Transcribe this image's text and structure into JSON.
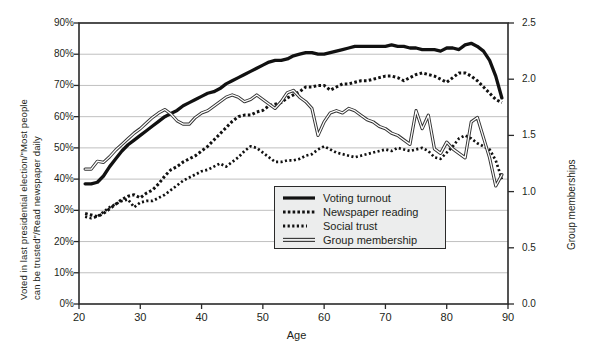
{
  "chart_data": {
    "type": "line",
    "title": "",
    "xlabel": "Age",
    "ylabel_left": "Voted in last presidential election/\"Most people can be trusted\"/Read newspaper daily",
    "ylabel_left_line1": "Voted in last presidential election/\"Most people",
    "ylabel_left_line2": "can be trusted\"/Read newspaper daily",
    "ylabel_right": "Group memberships",
    "xlim": [
      20,
      90
    ],
    "ylim_left": [
      0,
      90
    ],
    "ylim_right": [
      0.0,
      2.5
    ],
    "grid": true,
    "legend_position": "center",
    "xticks": [
      20,
      30,
      40,
      50,
      60,
      70,
      80,
      90
    ],
    "xtick_labels": [
      "20",
      "30",
      "40",
      "50",
      "60",
      "70",
      "80",
      "90"
    ],
    "yticks_left": [
      0,
      10,
      20,
      30,
      40,
      50,
      60,
      70,
      80,
      90
    ],
    "ytick_labels_left": [
      "0%",
      "10%",
      "20%",
      "30%",
      "40%",
      "50%",
      "60%",
      "70%",
      "80%",
      "90%"
    ],
    "yticks_right": [
      0.0,
      0.5,
      1.0,
      1.5,
      2.0,
      2.5
    ],
    "ytick_labels_right": [
      "0.0",
      "0.5",
      "1.0",
      "1.5",
      "2.0",
      "2.5"
    ],
    "x": [
      21,
      22,
      23,
      24,
      25,
      26,
      27,
      28,
      29,
      30,
      31,
      32,
      33,
      34,
      35,
      36,
      37,
      38,
      39,
      40,
      41,
      42,
      43,
      44,
      45,
      46,
      47,
      48,
      49,
      50,
      51,
      52,
      53,
      54,
      55,
      56,
      57,
      58,
      59,
      60,
      61,
      62,
      63,
      64,
      65,
      66,
      67,
      68,
      69,
      70,
      71,
      72,
      73,
      74,
      75,
      76,
      77,
      78,
      79,
      80,
      81,
      82,
      83,
      84,
      85,
      86,
      87,
      88,
      89
    ],
    "series": [
      {
        "name": "Voting turnout",
        "axis": "left",
        "style": "solid-thick",
        "color": "#111111",
        "values": [
          38.5,
          38.5,
          39.0,
          41.0,
          44.0,
          46.5,
          49.0,
          51.0,
          52.5,
          54.0,
          55.5,
          57.0,
          58.5,
          60.0,
          61.0,
          62.0,
          63.5,
          64.5,
          65.5,
          66.5,
          67.5,
          68.0,
          69.0,
          70.5,
          71.5,
          72.5,
          73.5,
          74.5,
          75.5,
          76.5,
          77.5,
          78.0,
          78.0,
          78.5,
          79.5,
          80.0,
          80.5,
          80.5,
          80.0,
          80.0,
          80.5,
          81.0,
          81.5,
          82.0,
          82.5,
          82.5,
          82.5,
          82.5,
          82.5,
          82.5,
          83.0,
          82.5,
          82.5,
          82.0,
          82.0,
          81.5,
          81.5,
          81.5,
          81.0,
          82.0,
          82.0,
          81.5,
          83.0,
          83.5,
          82.5,
          81.0,
          78.0,
          73.0,
          66.0
        ]
      },
      {
        "name": "Newspaper reading",
        "axis": "left",
        "style": "dotted-bold",
        "color": "#111111",
        "values": [
          29.0,
          28.5,
          28.0,
          29.0,
          30.5,
          32.0,
          33.5,
          34.5,
          35.0,
          34.0,
          35.5,
          36.5,
          38.5,
          41.0,
          43.0,
          44.0,
          45.5,
          46.5,
          47.5,
          49.0,
          50.5,
          52.5,
          54.5,
          56.5,
          58.5,
          60.0,
          60.5,
          60.5,
          61.5,
          62.0,
          63.5,
          64.0,
          64.5,
          66.0,
          67.0,
          68.0,
          69.5,
          69.5,
          70.0,
          70.0,
          68.5,
          69.5,
          70.5,
          70.5,
          71.0,
          71.5,
          71.5,
          72.0,
          72.5,
          73.0,
          73.0,
          72.5,
          71.5,
          72.5,
          73.5,
          74.0,
          73.5,
          73.0,
          72.0,
          71.0,
          72.5,
          74.0,
          74.0,
          73.0,
          71.5,
          69.5,
          67.5,
          65.5,
          64.5
        ]
      },
      {
        "name": "Social trust",
        "axis": "left",
        "style": "dotted-fine",
        "color": "#111111",
        "values": [
          28.0,
          27.5,
          28.0,
          29.5,
          31.0,
          32.0,
          33.0,
          33.5,
          31.0,
          32.5,
          33.0,
          33.0,
          34.0,
          35.0,
          36.5,
          38.0,
          39.5,
          40.5,
          41.5,
          42.5,
          43.0,
          44.0,
          45.0,
          44.0,
          45.5,
          47.0,
          49.0,
          50.5,
          50.0,
          48.5,
          47.0,
          45.5,
          45.5,
          46.0,
          46.0,
          46.5,
          47.5,
          48.0,
          49.5,
          50.5,
          49.5,
          48.5,
          48.0,
          47.5,
          47.0,
          47.5,
          48.0,
          48.5,
          49.0,
          49.5,
          49.0,
          50.0,
          49.5,
          49.0,
          49.5,
          50.0,
          49.0,
          47.0,
          46.5,
          48.5,
          50.5,
          53.0,
          54.0,
          53.0,
          51.5,
          50.5,
          49.5,
          46.0,
          40.0
        ]
      },
      {
        "name": "Group membership",
        "axis": "right",
        "style": "double-thin",
        "color": "#444444",
        "values": [
          1.2,
          1.2,
          1.27,
          1.26,
          1.31,
          1.37,
          1.42,
          1.47,
          1.52,
          1.56,
          1.61,
          1.66,
          1.7,
          1.73,
          1.69,
          1.63,
          1.6,
          1.6,
          1.66,
          1.7,
          1.72,
          1.76,
          1.8,
          1.84,
          1.86,
          1.84,
          1.8,
          1.82,
          1.86,
          1.82,
          1.78,
          1.74,
          1.8,
          1.88,
          1.9,
          1.84,
          1.8,
          1.74,
          1.5,
          1.62,
          1.7,
          1.72,
          1.7,
          1.74,
          1.72,
          1.68,
          1.64,
          1.62,
          1.58,
          1.56,
          1.52,
          1.5,
          1.46,
          1.42,
          1.72,
          1.56,
          1.68,
          1.38,
          1.34,
          1.44,
          1.38,
          1.34,
          1.3,
          1.62,
          1.66,
          1.48,
          1.3,
          1.05,
          1.15
        ]
      }
    ]
  },
  "legend": {
    "items": [
      {
        "label": "Voting turnout",
        "key": "solid-thick"
      },
      {
        "label": "Newspaper reading",
        "key": "dotted-bold"
      },
      {
        "label": "Social trust",
        "key": "dotted-fine"
      },
      {
        "label": "Group membership",
        "key": "double-thin"
      }
    ]
  },
  "colors": {
    "background": "#ffffff",
    "axis": "#2a2a2a",
    "grid": "#b9b9b9",
    "text": "#231f20",
    "legend_bg": "#eceded"
  }
}
